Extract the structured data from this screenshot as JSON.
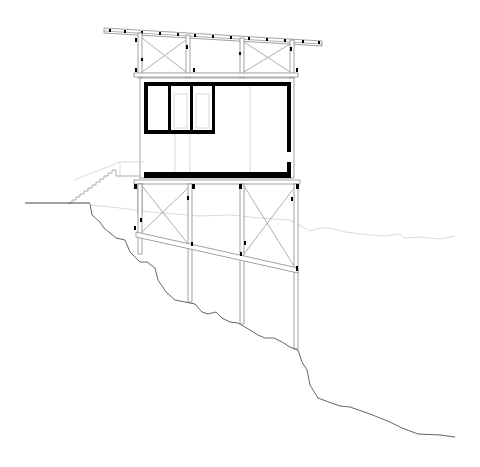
{
  "drawing": {
    "type": "architectural-section",
    "subject": "cabin on stilts over sloping terrain",
    "colors": {
      "background": "#ffffff",
      "wall": "#000000",
      "line": "#8a8a8a",
      "ground": "#555555"
    },
    "elements": [
      "roof",
      "roof-truss",
      "cabin-walls",
      "window",
      "floor-slab",
      "stair",
      "stilt-frame",
      "cross-bracing",
      "ground-profile",
      "distant-terrain-line"
    ]
  }
}
